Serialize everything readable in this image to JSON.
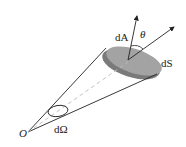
{
  "diagram": {
    "type": "solid-angle-cone",
    "labels": {
      "origin": "O",
      "solid_angle": "dΩ",
      "area_element": "dA",
      "surface_element": "dS",
      "angle": "θ"
    },
    "colors": {
      "line": "#222222",
      "surface_fill": "#9a9a9a",
      "surface_side": "#777777",
      "dashed_axis": "#bbbbbb"
    }
  }
}
